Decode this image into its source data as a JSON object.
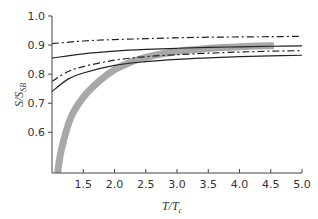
{
  "chart_data": {
    "type": "line",
    "title": "",
    "xlabel": "T/Tc",
    "xlabel_main": "T/T",
    "xlabel_sub": "c",
    "ylabel": "S/S_SB",
    "ylabel_main": "S/S",
    "ylabel_sub": "SB",
    "xlim": [
      1.0,
      5.0
    ],
    "ylim": [
      0.46,
      1.0
    ],
    "grid": false,
    "legend": null,
    "xticks": [
      1.5,
      2.0,
      2.5,
      3.0,
      3.5,
      4.0,
      4.5,
      5.0
    ],
    "xtick_labels": [
      "1.5",
      "2.0",
      "2.5",
      "3.0",
      "3.5",
      "4.0",
      "4.5",
      "5.0"
    ],
    "yticks": [
      0.6,
      0.7,
      0.8,
      0.9,
      1.0
    ],
    "ytick_labels": [
      "0.6",
      "0.7",
      "0.8",
      "0.9",
      "1.0"
    ],
    "series": [
      {
        "name": "upper dash-dot",
        "style": "dashdot",
        "color": "#222222",
        "width": 1.2,
        "x": [
          1.0,
          1.5,
          2.0,
          2.5,
          3.0,
          3.5,
          4.0,
          4.5,
          5.0
        ],
        "y": [
          0.905,
          0.914,
          0.919,
          0.922,
          0.925,
          0.927,
          0.928,
          0.929,
          0.93
        ]
      },
      {
        "name": "upper solid",
        "style": "solid",
        "color": "#222222",
        "width": 1.2,
        "x": [
          1.0,
          1.5,
          2.0,
          2.5,
          3.0,
          3.5,
          4.0,
          4.5,
          5.0
        ],
        "y": [
          0.855,
          0.87,
          0.879,
          0.885,
          0.889,
          0.892,
          0.894,
          0.896,
          0.897
        ]
      },
      {
        "name": "lower dash-dot",
        "style": "dashdot",
        "color": "#222222",
        "width": 1.2,
        "x": [
          1.0,
          1.25,
          1.5,
          2.0,
          2.5,
          3.0,
          3.5,
          4.0,
          4.5,
          5.0
        ],
        "y": [
          0.775,
          0.808,
          0.826,
          0.848,
          0.86,
          0.867,
          0.872,
          0.876,
          0.879,
          0.881
        ]
      },
      {
        "name": "lower solid",
        "style": "solid",
        "color": "#222222",
        "width": 1.2,
        "x": [
          1.0,
          1.25,
          1.5,
          2.0,
          2.5,
          3.0,
          3.5,
          4.0,
          4.5,
          5.0
        ],
        "y": [
          0.74,
          0.782,
          0.804,
          0.83,
          0.843,
          0.851,
          0.856,
          0.86,
          0.863,
          0.865
        ]
      },
      {
        "name": "lattice data (thick gray band)",
        "style": "band",
        "color": "#a8a8a8",
        "width": 7,
        "x": [
          1.09,
          1.15,
          1.3,
          1.5,
          1.75,
          2.0,
          2.25,
          2.5,
          3.0,
          3.5,
          4.0,
          4.55
        ],
        "y": [
          0.46,
          0.54,
          0.65,
          0.72,
          0.775,
          0.815,
          0.84,
          0.858,
          0.878,
          0.888,
          0.894,
          0.898
        ]
      }
    ]
  }
}
